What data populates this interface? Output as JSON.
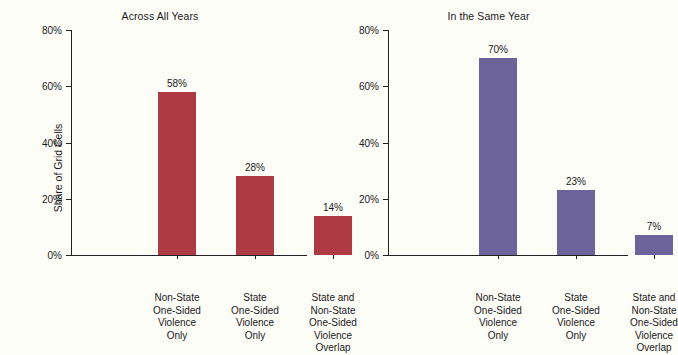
{
  "figure": {
    "background_color": "#fdfdf8",
    "axis_color": "#222222",
    "text_color": "#1a1a1a"
  },
  "axis_title_y": "Share of Grid Cells",
  "chart_data": [
    {
      "type": "bar",
      "title": "Across All Years",
      "xlabel": "",
      "ylabel": "Share of Grid Cells",
      "ylim": [
        0,
        80
      ],
      "yticks": [
        0,
        20,
        40,
        60,
        80
      ],
      "ytick_labels": [
        "0%",
        "20%",
        "40%",
        "60%",
        "80%"
      ],
      "grid": false,
      "legend": "none",
      "bar_color": "#ae3b44",
      "categories": [
        "Non-State\nOne-Sided\nViolence\nOnly",
        "State\nOne-Sided\nViolence\nOnly",
        "State and\nNon-State\nOne-Sided\nViolence\nOverlap"
      ],
      "category_lines": [
        [
          "Non-State",
          "One-Sided",
          "Violence",
          "Only"
        ],
        [
          "State",
          "One-Sided",
          "Violence",
          "Only"
        ],
        [
          "State and",
          "Non-State",
          "One-Sided",
          "Violence",
          "Overlap"
        ]
      ],
      "values": [
        58,
        28,
        14
      ],
      "value_labels": [
        "58%",
        "28%",
        "14%"
      ]
    },
    {
      "type": "bar",
      "title": "In the Same Year",
      "xlabel": "",
      "ylabel": "",
      "ylim": [
        0,
        80
      ],
      "yticks": [
        0,
        20,
        40,
        60,
        80
      ],
      "ytick_labels": [
        "0%",
        "20%",
        "40%",
        "60%",
        "80%"
      ],
      "grid": false,
      "legend": "none",
      "bar_color": "#6b6399",
      "categories": [
        "Non-State\nOne-Sided\nViolence\nOnly",
        "State\nOne-Sided\nViolence\nOnly",
        "State and\nNon-State\nOne-Sided\nViolence\nOverlap"
      ],
      "category_lines": [
        [
          "Non-State",
          "One-Sided",
          "Violence",
          "Only"
        ],
        [
          "State",
          "One-Sided",
          "Violence",
          "Only"
        ],
        [
          "State and",
          "Non-State",
          "One-Sided",
          "Violence",
          "Overlap"
        ]
      ],
      "values": [
        70,
        23,
        7
      ],
      "value_labels": [
        "70%",
        "23%",
        "7%"
      ]
    }
  ]
}
